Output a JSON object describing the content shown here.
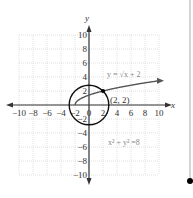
{
  "chart_data": {
    "type": "line",
    "title": "",
    "xlabel": "x",
    "ylabel": "y",
    "xlim": [
      -10,
      10
    ],
    "ylim": [
      -10,
      10
    ],
    "grid": true,
    "x_ticks": [
      "−10",
      "−8",
      "−6",
      "−4",
      "−2",
      "0",
      "2",
      "4",
      "6",
      "8",
      "10"
    ],
    "y_ticks": [
      "10",
      "8",
      "6",
      "4",
      "2",
      "−2",
      "−4",
      "−6",
      "−8",
      "−10"
    ],
    "x_tick_values": [
      -10,
      -8,
      -6,
      -4,
      -2,
      0,
      2,
      4,
      6,
      8,
      10
    ],
    "y_tick_values": [
      10,
      8,
      6,
      4,
      2,
      -2,
      -4,
      -6,
      -8,
      -10
    ],
    "series": [
      {
        "name": "y = √(x + 2)",
        "kind": "curve",
        "domain": [
          -2,
          10
        ]
      },
      {
        "name": "x² + y² = 8",
        "kind": "circle",
        "center": [
          0,
          0
        ],
        "radius_squared": 8
      }
    ],
    "points": [
      {
        "label": "(2, 2)",
        "x": 2,
        "y": 2
      }
    ],
    "annotations": {
      "curve_label": "y = √x + 2",
      "circle_label": "x² + y² =8",
      "point_label": "(2, 2)"
    }
  },
  "side": {
    "marker": "dot"
  }
}
